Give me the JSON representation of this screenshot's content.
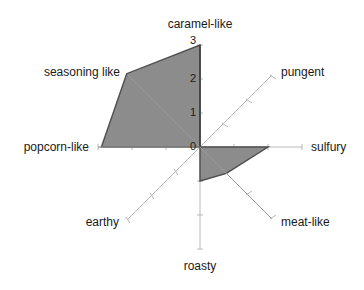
{
  "chart_data": {
    "type": "radar",
    "title": "",
    "subtitle": "",
    "xlabel": "",
    "ylabel": "",
    "grid": false,
    "legend": null,
    "radial_axis": {
      "ticks": [
        "0",
        "1",
        "2",
        "3"
      ],
      "tick_values": [
        0,
        1,
        2,
        3
      ],
      "range": [
        0,
        3
      ],
      "position": "vertical-up-from-center"
    },
    "categories": [
      "caramel-like",
      "pungent",
      "sulfury",
      "meat-like",
      "roasty",
      "earthy",
      "popcorn-like",
      "seasoning like"
    ],
    "angles_deg": [
      90,
      45,
      0,
      -45,
      -90,
      -135,
      180,
      135
    ],
    "series": [
      {
        "name": "",
        "values": [
          3.0,
          0.0,
          2.0,
          1.1,
          1.0,
          0.0,
          2.9,
          3.05
        ]
      }
    ],
    "fill_color": "#8c8c8c",
    "stroke_color": "#4d4d4d",
    "axis_color": "#b3b3b3",
    "text_color": "#1a1a1a"
  },
  "labels": {
    "caramel_like": "caramel-like",
    "pungent": "pungent",
    "sulfury": "sulfury",
    "meat_like": "meat-like",
    "roasty": "roasty",
    "earthy": "earthy",
    "popcorn_like": "popcorn-like",
    "seasoning_like": "seasoning like"
  },
  "ticks": {
    "t3": "3",
    "t2": "2",
    "t1": "1",
    "t0": "0"
  }
}
